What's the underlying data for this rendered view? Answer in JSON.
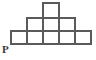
{
  "figure": {
    "shape_type": "staircase-pyramid",
    "unit_cell_size": 16,
    "stroke_color": "#5a5a5a",
    "fill_color": "#ffffff",
    "background_color": "#ffffff",
    "stroke_width": 2,
    "rows": [
      {
        "name": "bottom-row",
        "cell_count": 5,
        "x_start": 11,
        "y_top": 31,
        "y_bottom": 44,
        "cells_x": [
          11,
          27,
          43,
          59,
          75
        ]
      },
      {
        "name": "middle-row",
        "cell_count": 3,
        "x_start": 27,
        "y_top": 18,
        "y_bottom": 31,
        "cells_x": [
          27,
          43,
          59
        ]
      },
      {
        "name": "top-row",
        "cell_count": 1,
        "x_start": 43,
        "y_top": 3,
        "y_bottom": 18,
        "cells_x": [
          43
        ]
      }
    ],
    "total_cells": 9,
    "labels": [
      {
        "name": "vertex-p",
        "text": "P",
        "x": 2,
        "y": 53,
        "anchor_vertex_x": 11,
        "anchor_vertex_y": 44
      }
    ]
  }
}
